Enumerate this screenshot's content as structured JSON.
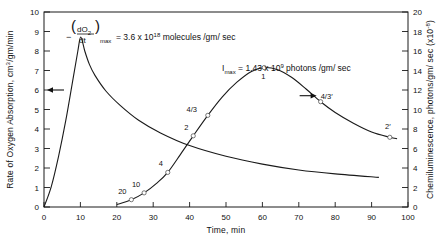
{
  "chart_data": {
    "type": "line",
    "title": "",
    "xlabel": "Time, min",
    "ylabel": "Rate of Oxygen Absorption, cm3/gm/min",
    "y2label": "Chemiluminescence, photons/gm/ sec  (x10-8)",
    "xlim": [
      0,
      100
    ],
    "ylim": [
      0,
      10
    ],
    "y2lim": [
      0,
      20
    ],
    "grid": false,
    "legend": "none",
    "xticks": [
      "0",
      "10",
      "20",
      "30",
      "40",
      "50",
      "60",
      "70",
      "80",
      "90",
      "100"
    ],
    "yticks": [
      "0",
      "1",
      "2",
      "3",
      "4",
      "5",
      "6",
      "7",
      "8",
      "9",
      "10"
    ],
    "y2ticks": [
      "0",
      "2",
      "4",
      "6",
      "8",
      "10",
      "12",
      "14",
      "16",
      "18",
      "20"
    ],
    "annotations": [
      {
        "name": "oxygen-rate-max",
        "text": "= 3.6 x 10",
        "lead": "−",
        "frac_num": "dO",
        "frac_num_sub": "2",
        "frac_den": "dt",
        "sub": "max",
        "exp": "18",
        "tail": "molecules /gm/ sec"
      },
      {
        "name": "imax",
        "text": "= 1.43 x 10",
        "lead": "I",
        "sub": "max",
        "exp": "9",
        "tail": "photons /gm/ sec"
      }
    ],
    "series": [
      {
        "name": "oxygen-absorption",
        "axis": "left",
        "arrow": "left",
        "points": [
          {
            "x": 0,
            "y": 0
          },
          {
            "x": 2,
            "y": 1.05
          },
          {
            "x": 4,
            "y": 2.6
          },
          {
            "x": 6,
            "y": 4.45
          },
          {
            "x": 8,
            "y": 6.6
          },
          {
            "x": 9.3,
            "y": 8.0
          },
          {
            "x": 10.1,
            "y": 8.72
          },
          {
            "x": 11.2,
            "y": 8.0
          },
          {
            "x": 12.5,
            "y": 7.3
          },
          {
            "x": 14,
            "y": 6.75
          },
          {
            "x": 17,
            "y": 5.95
          },
          {
            "x": 21,
            "y": 5.2
          },
          {
            "x": 26,
            "y": 4.45
          },
          {
            "x": 32,
            "y": 3.8
          },
          {
            "x": 40,
            "y": 3.15
          },
          {
            "x": 50,
            "y": 2.6
          },
          {
            "x": 60,
            "y": 2.2
          },
          {
            "x": 70,
            "y": 1.9
          },
          {
            "x": 80,
            "y": 1.7
          },
          {
            "x": 92,
            "y": 1.52
          }
        ]
      },
      {
        "name": "chemiluminescence",
        "axis": "right",
        "arrow": "right",
        "points": [
          {
            "x": 20,
            "y": 0.25
          },
          {
            "x": 24,
            "y": 0.75
          },
          {
            "x": 27.5,
            "y": 1.45
          },
          {
            "x": 31,
            "y": 2.45
          },
          {
            "x": 34,
            "y": 3.55
          },
          {
            "x": 37.5,
            "y": 5.4
          },
          {
            "x": 41,
            "y": 7.3
          },
          {
            "x": 45,
            "y": 9.4
          },
          {
            "x": 49,
            "y": 11.3
          },
          {
            "x": 53,
            "y": 12.8
          },
          {
            "x": 57,
            "y": 13.9
          },
          {
            "x": 60.5,
            "y": 14.3
          },
          {
            "x": 64,
            "y": 14.1
          },
          {
            "x": 68,
            "y": 13.3
          },
          {
            "x": 72,
            "y": 12.1
          },
          {
            "x": 76,
            "y": 10.8
          },
          {
            "x": 80,
            "y": 9.7
          },
          {
            "x": 85,
            "y": 8.6
          },
          {
            "x": 90,
            "y": 7.7
          },
          {
            "x": 95,
            "y": 7.15
          },
          {
            "x": 97,
            "y": 7.0
          }
        ],
        "markers": [
          {
            "x": 24,
            "y": 0.75,
            "label": "20",
            "lx": -9,
            "ly": -6
          },
          {
            "x": 27.5,
            "y": 1.45,
            "label": "10",
            "lx": -8,
            "ly": -6
          },
          {
            "x": 34,
            "y": 3.55,
            "label": "4",
            "lx": -7,
            "ly": -6
          },
          {
            "x": 41,
            "y": 7.3,
            "label": "2",
            "lx": -7,
            "ly": -6
          },
          {
            "x": 45,
            "y": 9.4,
            "label": "4/3",
            "lx": -16,
            "ly": -3
          },
          {
            "x": 60.5,
            "y": 14.3,
            "label": "1",
            "lx": -1,
            "ly": 11
          },
          {
            "x": 76,
            "y": 10.8,
            "label": "4/3′",
            "lx": 6,
            "ly": -3
          },
          {
            "x": 95,
            "y": 7.15,
            "label": "2′",
            "lx": -2,
            "ly": -8
          }
        ]
      }
    ]
  }
}
